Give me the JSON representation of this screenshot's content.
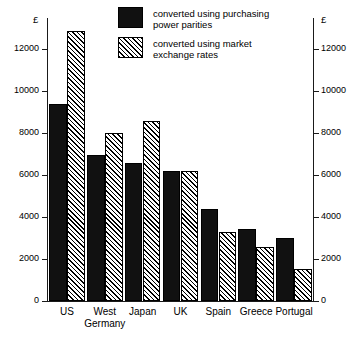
{
  "chart_data": {
    "type": "bar",
    "title": "",
    "subtitle": "",
    "xlabel": "",
    "ylabel": "",
    "y_unit_label": "£",
    "categories": [
      "US",
      "West Germany",
      "Japan",
      "UK",
      "Spain",
      "Greece",
      "Portugal"
    ],
    "category_lines": [
      [
        "US"
      ],
      [
        "West",
        "Germany"
      ],
      [
        "Japan"
      ],
      [
        "UK"
      ],
      [
        "Spain"
      ],
      [
        "Greece"
      ],
      [
        "Portugal"
      ]
    ],
    "series": [
      {
        "name": "converted using purchasing power parities",
        "name_lines": [
          "converted using purchasing",
          "power  parities"
        ],
        "style": "solid",
        "color": "#111111",
        "values": [
          9400,
          6950,
          6600,
          6200,
          4400,
          3450,
          3000
        ]
      },
      {
        "name": "converted using market exchange rates",
        "name_lines": [
          "converted using market",
          "exchange rates"
        ],
        "style": "hatch-diagonal",
        "color": "#ffffff",
        "values": [
          12900,
          8000,
          8600,
          6200,
          3300,
          2600,
          1550
        ]
      }
    ],
    "ylim": [
      0,
      13500
    ],
    "yticks": [
      0,
      2000,
      4000,
      6000,
      8000,
      10000,
      12000
    ],
    "ytick_labels": [
      "0",
      "2000",
      "4000",
      "6000",
      "8000",
      "10000",
      "12000"
    ],
    "grid": false,
    "dual_axis": true,
    "legend_position": "top-center",
    "axis_color": "#1a1a1a"
  }
}
